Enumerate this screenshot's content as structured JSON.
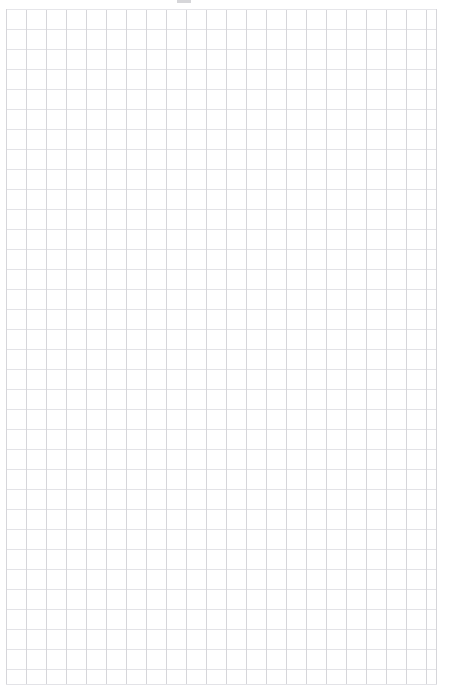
{
  "page": {
    "background_color": "#ffffff",
    "width_px": 451,
    "height_px": 694
  },
  "grid": {
    "name": "graph-paper-grid",
    "cell_size_px": 20,
    "columns": 22,
    "rows": 34,
    "origin_x_px": 6,
    "origin_y_px": 9,
    "width_px": 431,
    "height_px": 676,
    "vertical_line_color": "#d6d6da",
    "horizontal_line_color": "#e3e3e7",
    "line_width_px": 1,
    "label": ""
  },
  "artifact": {
    "name": "top-edge-smudge",
    "x_px": 177,
    "y_px": 0,
    "width_px": 14,
    "height_px": 3,
    "color": "#78788a",
    "label": ""
  },
  "margins": {
    "left_px": 6,
    "top_px": 9,
    "right_px": 14,
    "bottom_px": 9
  }
}
